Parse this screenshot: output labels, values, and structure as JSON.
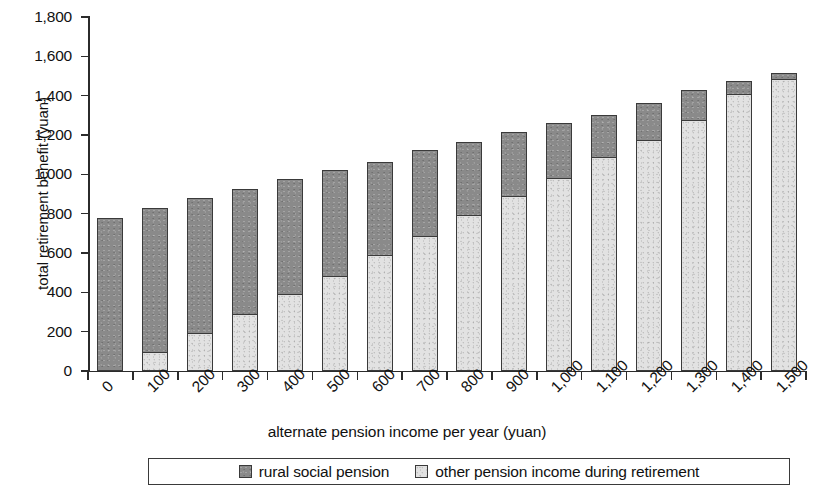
{
  "chart_data": {
    "type": "bar",
    "subtype": "stacked-vertical",
    "title": "",
    "xlabel": "alternate pension income per year (yuan)",
    "ylabel": "total retirement benefit (yuan)",
    "categories": [
      "0",
      "100",
      "200",
      "300",
      "400",
      "500",
      "600",
      "700",
      "800",
      "900",
      "1,000",
      "1,100",
      "1,200",
      "1,300",
      "1,400",
      "1,500"
    ],
    "series": [
      {
        "name": "other pension income during retirement",
        "color": "#e2e2e2",
        "values": [
          0,
          95,
          195,
          290,
          390,
          485,
          590,
          685,
          795,
          890,
          980,
          1090,
          1175,
          1275,
          1410,
          1485
        ]
      },
      {
        "name": "rural social pension",
        "color": "#8a8a8a",
        "values": [
          780,
          740,
          690,
          640,
          590,
          545,
          480,
          445,
          375,
          330,
          285,
          220,
          195,
          160,
          70,
          35
        ]
      }
    ],
    "totals": [
      780,
      835,
      885,
      930,
      980,
      1030,
      1070,
      1130,
      1170,
      1220,
      1265,
      1310,
      1375,
      1435,
      1480,
      1520
    ],
    "ylim": [
      0,
      1800
    ],
    "ytick_step": 200,
    "yticks": [
      "0",
      "200",
      "400",
      "600",
      "800",
      "1,000",
      "1,200",
      "1,400",
      "1,600",
      "1,800"
    ],
    "ytick_values": [
      0,
      200,
      400,
      600,
      800,
      1000,
      1200,
      1400,
      1600,
      1800
    ],
    "grid": false,
    "legend_position": "bottom",
    "xtick_label_rotation": -45
  },
  "legend": {
    "items": [
      {
        "label": "rural social pension",
        "style": "dark"
      },
      {
        "label": "other pension income during retirement",
        "style": "light"
      }
    ]
  }
}
